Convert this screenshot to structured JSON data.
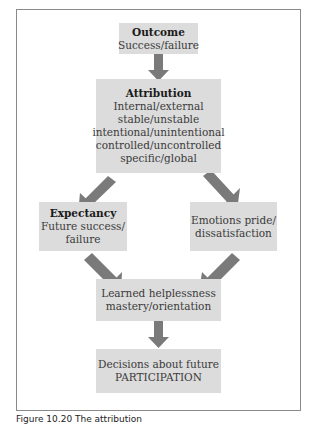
{
  "diagram": {
    "nodes": [
      {
        "id": "outcome",
        "title": "Outcome",
        "lines": [
          "Success/failure"
        ]
      },
      {
        "id": "attribution",
        "title": "Attribution",
        "lines": [
          "Internal/external",
          "stable/unstable",
          "intentional/unintentional",
          "controlled/uncontrolled",
          "specific/global"
        ]
      },
      {
        "id": "expectancy",
        "title": "Expectancy",
        "lines": [
          "Future success/",
          "failure"
        ]
      },
      {
        "id": "emotions",
        "title": "",
        "lines": [
          "Emotions pride/",
          "dissatisfaction"
        ]
      },
      {
        "id": "helplessness",
        "title": "",
        "lines": [
          "Learned helplessness",
          "mastery/orientation"
        ]
      },
      {
        "id": "decisions",
        "title": "",
        "lines": [
          "Decisions about future",
          "PARTICIPATION"
        ]
      }
    ],
    "edges": [
      [
        "outcome",
        "attribution"
      ],
      [
        "attribution",
        "expectancy"
      ],
      [
        "attribution",
        "emotions"
      ],
      [
        "expectancy",
        "helplessness"
      ],
      [
        "emotions",
        "helplessness"
      ],
      [
        "helplessness",
        "decisions"
      ]
    ],
    "colors": {
      "box": "#dcdcdc",
      "arrow": "#7a7a7a",
      "frame": "#8a8a8a"
    },
    "caption": "Figure 10.20 The attribution"
  }
}
